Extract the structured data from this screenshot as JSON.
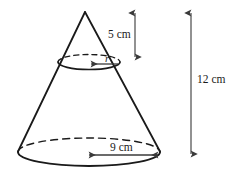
{
  "figure": {
    "background_color": "#ffffff",
    "outline_color": "#1a1a1a",
    "arrow_color": "#6e6e6e",
    "labels": {
      "upper_height": "5 cm",
      "upper_radius": "r",
      "base_radius": "9 cm",
      "total_height": "12 cm"
    },
    "shapes": {
      "cone_apex": {
        "x": 85,
        "y": 12
      },
      "base_ellipse": {
        "cx": 89,
        "cy": 152,
        "rx": 71,
        "ry": 14
      },
      "top_ellipse": {
        "cx": 89,
        "cy": 62,
        "rx": 31,
        "ry": 7
      }
    },
    "dimension_arrows": [
      {
        "name": "upper-height-arrow",
        "orientation": "vertical",
        "x": 135,
        "y1": 11,
        "y2": 59,
        "label": "5 cm"
      },
      {
        "name": "upper-radius-arrow",
        "orientation": "horizontal",
        "y": 64,
        "x1": 89,
        "x2": 119,
        "label": "r"
      },
      {
        "name": "base-radius-arrow",
        "orientation": "horizontal",
        "y": 155,
        "x1": 88,
        "x2": 159,
        "label": "9 cm"
      },
      {
        "name": "total-height-arrow",
        "orientation": "vertical",
        "x": 191,
        "y1": 11,
        "y2": 156,
        "label": "12 cm"
      }
    ]
  }
}
